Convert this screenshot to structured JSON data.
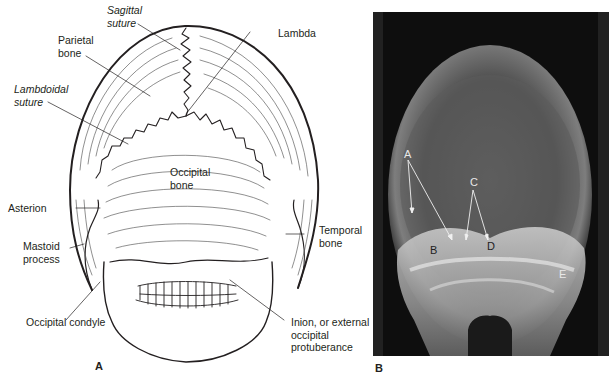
{
  "figure": {
    "panel_a": {
      "letter": "A",
      "labels": {
        "sagittal_suture": [
          "Sagittal",
          "suture"
        ],
        "parietal_bone": [
          "Parietal",
          "bone"
        ],
        "lambda": "Lambda",
        "lambdoidal_suture": [
          "Lambdoidal",
          "suture"
        ],
        "occipital_bone": [
          "Occipital",
          "bone"
        ],
        "asterion": "Asterion",
        "temporal_bone": [
          "Temporal",
          "bone"
        ],
        "mastoid_process": [
          "Mastoid",
          "process"
        ],
        "occipital_condyle": "Occipital condyle",
        "inion": [
          "Inion, or external",
          "occipital",
          "protuberance"
        ]
      }
    },
    "panel_b": {
      "letter": "B",
      "markers": [
        "A",
        "B",
        "C",
        "D",
        "E"
      ]
    }
  }
}
